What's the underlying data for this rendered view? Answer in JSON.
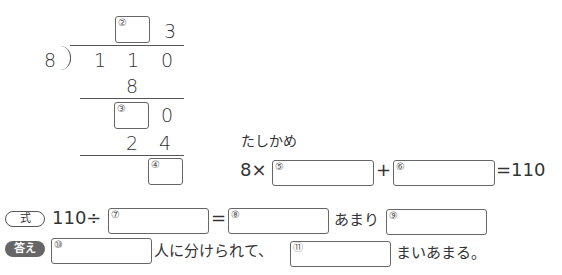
{
  "division": {
    "divisor": "8",
    "dividend": [
      "1",
      "1",
      "0"
    ],
    "quotient_ones": "3",
    "step1_product": "8",
    "step2_ones": "0",
    "step2_product": [
      "2",
      "4"
    ],
    "blanks": {
      "b2": "②",
      "b3": "③",
      "b4": "④"
    }
  },
  "check": {
    "label": "たしかめ",
    "prefix": "8×",
    "plus": "+",
    "result": "=110",
    "blanks": {
      "b5": "⑤",
      "b6": "⑥"
    }
  },
  "equation": {
    "badge": "式",
    "prefix": "110÷",
    "equals": "=",
    "remainder_label": "あまり",
    "blanks": {
      "b7": "⑦",
      "b8": "⑧",
      "b9": "⑨"
    }
  },
  "answer": {
    "badge": "答え",
    "text1": "人に分けられて、",
    "text2": "まいあまる。",
    "blanks": {
      "b10": "⑩",
      "b11": "⑪"
    }
  }
}
